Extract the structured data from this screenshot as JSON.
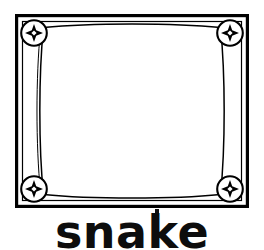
{
  "page": {
    "background_color": "#ffffff",
    "ink_color": "#000000",
    "width": 264,
    "height": 250
  },
  "caption": {
    "text": "snake",
    "color": "#0d0d0d",
    "font_weight": "bold",
    "style": "geometric-sans"
  },
  "illustration": {
    "name": "decorative-picture-frame",
    "description": "Ornamental rectangular picture frame with bowed inner panel and four circular corner medallions containing four-pointed stars",
    "empty_panel": true,
    "stroke_color": "#000000",
    "fill_color": "#ffffff",
    "outer_border": {
      "name": "outer-rectangle",
      "x": 16,
      "y": 15,
      "width": 232,
      "height": 192,
      "stroke_width": 3.2
    },
    "inner_rule": {
      "name": "inner-thin-rectangle",
      "x": 22,
      "y": 21,
      "width": 220,
      "height": 180,
      "stroke_width": 1.2
    },
    "bowed_panel": {
      "name": "bowed-inner-panel",
      "stroke_width": 1.4,
      "bow_depth": 10
    },
    "medallions": [
      {
        "name": "medallion-top-left",
        "cx": 34,
        "cy": 33,
        "r": 13
      },
      {
        "name": "medallion-top-right",
        "cx": 230,
        "cy": 33,
        "r": 13
      },
      {
        "name": "medallion-bottom-left",
        "cx": 34,
        "cy": 189,
        "r": 13
      },
      {
        "name": "medallion-bottom-right",
        "cx": 230,
        "cy": 189,
        "r": 13
      }
    ],
    "medallion_ornament": {
      "name": "four-pointed-star",
      "outer_radius": 9,
      "inner_radius": 3.1,
      "center_diamond_radius": 2.6,
      "fill": "#000000",
      "center_fill": "#ffffff"
    },
    "speck": {
      "name": "ink-speck",
      "x": 155,
      "y": 209,
      "width": 4,
      "height": 7
    }
  }
}
